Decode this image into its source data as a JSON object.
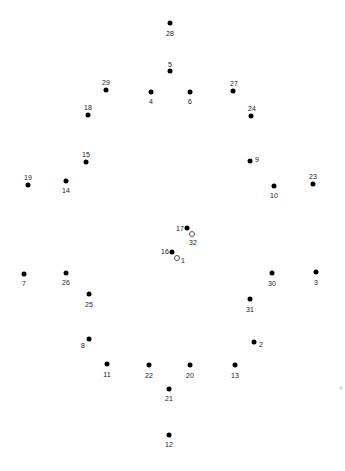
{
  "puzzle": {
    "title": "connect-the-dots",
    "width": 345,
    "height": 471,
    "background_color": "#ffffff",
    "dot_color": "#000000",
    "label_color": "#1a1a1a",
    "dot_count": 34,
    "dots": [
      {
        "label": "28",
        "x": 170,
        "y": 23,
        "lx": 170,
        "ly": 33,
        "style": "filled"
      },
      {
        "label": "5",
        "x": 170,
        "y": 71,
        "lx": 170,
        "ly": 64,
        "style": "filled"
      },
      {
        "label": "29",
        "x": 106,
        "y": 90,
        "lx": 106,
        "ly": 82,
        "style": "filled"
      },
      {
        "label": "4",
        "x": 151,
        "y": 92,
        "lx": 151,
        "ly": 101,
        "style": "filled"
      },
      {
        "label": "6",
        "x": 190,
        "y": 92,
        "lx": 190,
        "ly": 101,
        "style": "filled"
      },
      {
        "label": "27",
        "x": 233,
        "y": 91,
        "lx": 234,
        "ly": 83,
        "style": "filled"
      },
      {
        "label": "18",
        "x": 88,
        "y": 115,
        "lx": 88,
        "ly": 107,
        "style": "filled"
      },
      {
        "label": "24",
        "x": 251,
        "y": 116,
        "lx": 252,
        "ly": 108,
        "style": "filled"
      },
      {
        "label": "15",
        "x": 86,
        "y": 162,
        "lx": 86,
        "ly": 154,
        "style": "filled"
      },
      {
        "label": "9",
        "x": 250,
        "y": 161,
        "lx": 257,
        "ly": 159,
        "style": "filled"
      },
      {
        "label": "19",
        "x": 28,
        "y": 185,
        "lx": 28,
        "ly": 177,
        "style": "filled"
      },
      {
        "label": "14",
        "x": 66,
        "y": 181,
        "lx": 66,
        "ly": 190,
        "style": "filled"
      },
      {
        "label": "10",
        "x": 274,
        "y": 186,
        "lx": 274,
        "ly": 195,
        "style": "filled"
      },
      {
        "label": "23",
        "x": 313,
        "y": 184,
        "lx": 313,
        "ly": 176,
        "style": "filled"
      },
      {
        "label": "17",
        "x": 187,
        "y": 228,
        "lx": 180,
        "ly": 228,
        "style": "filled"
      },
      {
        "label": "32",
        "x": 192,
        "y": 234,
        "lx": 193,
        "ly": 242,
        "style": "hollow"
      },
      {
        "label": "16",
        "x": 172,
        "y": 252,
        "lx": 165,
        "ly": 251,
        "style": "filled"
      },
      {
        "label": "1",
        "x": 177,
        "y": 258,
        "lx": 183,
        "ly": 260,
        "style": "hollow"
      },
      {
        "label": "7",
        "x": 24,
        "y": 274,
        "lx": 24,
        "ly": 283,
        "style": "filled"
      },
      {
        "label": "26",
        "x": 66,
        "y": 273,
        "lx": 66,
        "ly": 282,
        "style": "filled"
      },
      {
        "label": "30",
        "x": 272,
        "y": 273,
        "lx": 272,
        "ly": 283,
        "style": "filled"
      },
      {
        "label": "3",
        "x": 316,
        "y": 272,
        "lx": 316,
        "ly": 282,
        "style": "filled"
      },
      {
        "label": "25",
        "x": 89,
        "y": 294,
        "lx": 89,
        "ly": 304,
        "style": "filled"
      },
      {
        "label": "31",
        "x": 250,
        "y": 299,
        "lx": 250,
        "ly": 309,
        "style": "filled"
      },
      {
        "label": "8",
        "x": 89,
        "y": 339,
        "lx": 83,
        "ly": 345,
        "style": "filled"
      },
      {
        "label": "2",
        "x": 254,
        "y": 342,
        "lx": 261,
        "ly": 344,
        "style": "filled"
      },
      {
        "label": "11",
        "x": 107,
        "y": 364,
        "lx": 107,
        "ly": 374,
        "style": "filled"
      },
      {
        "label": "22",
        "x": 149,
        "y": 365,
        "lx": 149,
        "ly": 375,
        "style": "filled"
      },
      {
        "label": "20",
        "x": 190,
        "y": 365,
        "lx": 190,
        "ly": 375,
        "style": "filled"
      },
      {
        "label": "13",
        "x": 235,
        "y": 365,
        "lx": 235,
        "ly": 375,
        "style": "filled"
      },
      {
        "label": "21",
        "x": 169,
        "y": 389,
        "lx": 169,
        "ly": 398,
        "style": "filled"
      },
      {
        "label": "12",
        "x": 169,
        "y": 435,
        "lx": 169,
        "ly": 444,
        "style": "filled"
      }
    ],
    "corner_mark": {
      "x": 341,
      "y": 388
    }
  }
}
